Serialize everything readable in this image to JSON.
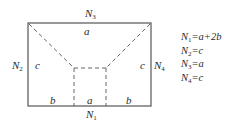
{
  "diagram": {
    "outer_rect": {
      "x1": 28,
      "y1": 23,
      "x2": 151,
      "y2": 106,
      "stroke": "#555555"
    },
    "inner_points": {
      "left_top": [
        74,
        68
      ],
      "right_top": [
        106,
        68
      ]
    },
    "dash_color": "#666666",
    "labels": {
      "top_force": {
        "letter": "N",
        "sub": "3"
      },
      "left_force": {
        "letter": "N",
        "sub": "2"
      },
      "right_force": {
        "letter": "N",
        "sub": "4"
      },
      "bottom_force": {
        "letter": "N",
        "sub": "1"
      },
      "top_edge": "a",
      "left_edge": "c",
      "right_edge": "c",
      "bottom_left": "b",
      "bottom_mid": "a",
      "bottom_right": "b"
    }
  },
  "legend": [
    {
      "letter": "N",
      "sub": "1",
      "rhs": "=a+2b"
    },
    {
      "letter": "N",
      "sub": "2",
      "rhs": "=c"
    },
    {
      "letter": "N",
      "sub": "3",
      "rhs": "=a"
    },
    {
      "letter": "N",
      "sub": "4",
      "rhs": "=c"
    }
  ]
}
